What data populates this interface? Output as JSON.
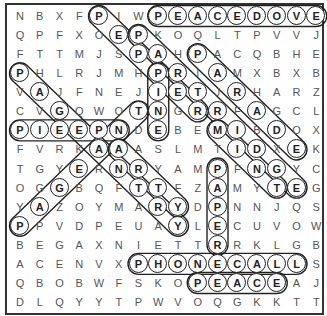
{
  "puzzle": {
    "type": "word-search",
    "rows": 16,
    "cols": 16,
    "grid": [
      "NBXFPIWPEACEDOVE",
      "QPFXOEPKOQLTPVVJ",
      "FTTMJSPAHPACQBHE",
      "PHLRJMHPRIAMXBXB",
      "VAJFNEJIETJRHARZ",
      "CVGQWOTNGRRFAGCL",
      "PIEEPNDEBEMIBDOX",
      "FVRKAAASLMTIDXEK",
      "TGYERNRYAMPFNGYC",
      "OGGBQFTTFZAMYTEG",
      "YAZOYMARYDPNNJQS",
      "PPVDPEUAYLECUVOW",
      "BEGAXNIETTRRKLGB",
      "ACENVXPHONECALLS",
      "QBOBWFSKOPEACEAJ",
      "DLQYYTPWVOQGKKTT"
    ],
    "found_words": [
      {
        "word": "PEACEDOVE",
        "start": [
          1,
          8
        ],
        "end": [
          1,
          16
        ]
      },
      {
        "word": "PEPPER",
        "start": [
          1,
          5
        ],
        "end": [
          6,
          10
        ]
      },
      {
        "word": "PARTRIDGE",
        "start": [
          2,
          7
        ],
        "end": [
          10,
          15
        ]
      },
      {
        "word": "PARADE",
        "start": [
          3,
          10
        ],
        "end": [
          8,
          15
        ]
      },
      {
        "word": "PINE",
        "start": [
          4,
          8
        ],
        "end": [
          7,
          8
        ]
      },
      {
        "word": "MINT",
        "start": [
          7,
          11
        ],
        "end": [
          10,
          14
        ]
      },
      {
        "word": "PAGEANTRY",
        "start": [
          4,
          1
        ],
        "end": [
          12,
          9
        ]
      },
      {
        "word": "PAGEANT",
        "start": [
          12,
          1
        ],
        "end": [
          6,
          7
        ]
      },
      {
        "word": "PIEEPN",
        "start": [
          7,
          1
        ],
        "end": [
          7,
          6
        ]
      },
      {
        "word": "ARTY",
        "start": [
          8,
          6
        ],
        "end": [
          11,
          9
        ]
      },
      {
        "word": "PAPER",
        "start": [
          9,
          11
        ],
        "end": [
          13,
          11
        ]
      },
      {
        "word": "PHONECALL",
        "start": [
          14,
          7
        ],
        "end": [
          14,
          15
        ]
      },
      {
        "word": "PEACE",
        "start": [
          15,
          10
        ],
        "end": [
          15,
          14
        ]
      }
    ]
  },
  "colors": {
    "background": "#ffffff",
    "letter": "#555555",
    "highlight_stroke": "#222222"
  }
}
